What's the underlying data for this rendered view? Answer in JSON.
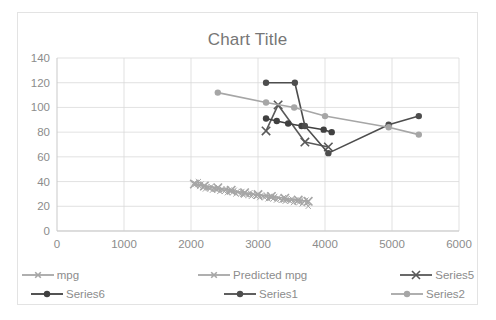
{
  "chart": {
    "title": "Chart Title",
    "border_color": "#e3e3e3",
    "background": "#ffffff",
    "grid_color": "#d9d9d9",
    "text_color": "#8c8c8c",
    "title_color": "#767676"
  },
  "legend": {
    "position": "bottom",
    "rows": [
      [
        {
          "label": "mpg",
          "color": "#a6a6a6",
          "marker": "x-small"
        },
        {
          "label": "Predicted mpg",
          "color": "#a6a6a6",
          "marker": "x-small"
        },
        {
          "label": "Series5",
          "color": "#595959",
          "marker": "x"
        }
      ],
      [
        {
          "label": "Series6",
          "color": "#404040",
          "marker": "circle"
        },
        {
          "label": "Series1",
          "color": "#4d4d4d",
          "marker": "circle"
        },
        {
          "label": "Series2",
          "color": "#a6a6a6",
          "marker": "circle"
        }
      ]
    ]
  },
  "chart_data": {
    "type": "scatter",
    "title": "Chart Title",
    "xlabel": "",
    "ylabel": "",
    "xlim": [
      0,
      6000
    ],
    "ylim": [
      0,
      140
    ],
    "xticks": [
      0,
      1000,
      2000,
      3000,
      4000,
      5000,
      6000
    ],
    "yticks": [
      0,
      20,
      40,
      60,
      80,
      100,
      120,
      140
    ],
    "grid": true,
    "legend_position": "bottom",
    "series": [
      {
        "name": "mpg",
        "color": "#a6a6a6",
        "marker": "x",
        "line": true,
        "points": [
          [
            2050,
            39
          ],
          [
            2075,
            38
          ],
          [
            2100,
            37.5
          ],
          [
            2110,
            40
          ],
          [
            2130,
            36
          ],
          [
            2150,
            38
          ],
          [
            2180,
            35
          ],
          [
            2200,
            37
          ],
          [
            2215,
            34
          ],
          [
            2240,
            36
          ],
          [
            2260,
            35
          ],
          [
            2280,
            34
          ],
          [
            2300,
            36
          ],
          [
            2320,
            33
          ],
          [
            2345,
            35
          ],
          [
            2360,
            34
          ],
          [
            2390,
            33
          ],
          [
            2410,
            35
          ],
          [
            2430,
            32
          ],
          [
            2460,
            34
          ],
          [
            2480,
            33
          ],
          [
            2500,
            32
          ],
          [
            2525,
            34
          ],
          [
            2545,
            31
          ],
          [
            2570,
            33
          ],
          [
            2600,
            32
          ],
          [
            2620,
            31
          ],
          [
            2645,
            33
          ],
          [
            2670,
            30
          ],
          [
            2690,
            32
          ],
          [
            2715,
            31
          ],
          [
            2740,
            30
          ],
          [
            2760,
            32
          ],
          [
            2785,
            29
          ],
          [
            2810,
            31
          ],
          [
            2830,
            30
          ],
          [
            2855,
            29
          ],
          [
            2880,
            31
          ],
          [
            2900,
            28
          ],
          [
            2925,
            30
          ],
          [
            2950,
            29
          ],
          [
            2975,
            28
          ],
          [
            3000,
            30
          ],
          [
            3025,
            27
          ],
          [
            3050,
            29
          ],
          [
            3075,
            28
          ],
          [
            3100,
            27
          ],
          [
            3125,
            29
          ],
          [
            3150,
            26
          ],
          [
            3175,
            28
          ],
          [
            3200,
            27
          ],
          [
            3225,
            26
          ],
          [
            3250,
            28
          ],
          [
            3275,
            25
          ],
          [
            3300,
            27
          ],
          [
            3330,
            26
          ],
          [
            3355,
            25
          ],
          [
            3380,
            27
          ],
          [
            3405,
            24
          ],
          [
            3430,
            26
          ],
          [
            3455,
            25
          ],
          [
            3480,
            24
          ],
          [
            3505,
            26
          ],
          [
            3530,
            23
          ],
          [
            3560,
            25
          ],
          [
            3585,
            24
          ],
          [
            3610,
            23
          ],
          [
            3635,
            25
          ],
          [
            3660,
            22
          ],
          [
            3690,
            24
          ],
          [
            3715,
            25
          ],
          [
            3740,
            23
          ],
          [
            3750,
            20
          ]
        ]
      },
      {
        "name": "Predicted mpg",
        "color": "#a6a6a6",
        "marker": "x",
        "line": true,
        "points": [
          [
            2050,
            38
          ],
          [
            2200,
            36.5
          ],
          [
            2400,
            35
          ],
          [
            2600,
            33
          ],
          [
            2800,
            31
          ],
          [
            3000,
            29.5
          ],
          [
            3200,
            28
          ],
          [
            3400,
            26.5
          ],
          [
            3600,
            25
          ],
          [
            3750,
            24
          ]
        ]
      },
      {
        "name": "Series5",
        "color": "#595959",
        "marker": "x",
        "line": true,
        "points": [
          [
            3120,
            81
          ],
          [
            3300,
            102
          ],
          [
            3700,
            72
          ],
          [
            4050,
            68
          ]
        ]
      },
      {
        "name": "Series6",
        "color": "#404040",
        "marker": "circle",
        "line": true,
        "points": [
          [
            3120,
            91
          ],
          [
            3280,
            89
          ],
          [
            3450,
            87
          ],
          [
            3650,
            85
          ],
          [
            3980,
            82
          ],
          [
            4100,
            80
          ]
        ]
      },
      {
        "name": "Series1",
        "color": "#4d4d4d",
        "marker": "circle",
        "line": true,
        "points": [
          [
            3120,
            120
          ],
          [
            3550,
            120
          ],
          [
            3700,
            85
          ],
          [
            4050,
            63
          ],
          [
            4950,
            86
          ],
          [
            5400,
            93
          ]
        ]
      },
      {
        "name": "Series2",
        "color": "#a6a6a6",
        "marker": "circle",
        "line": true,
        "points": [
          [
            2400,
            112
          ],
          [
            3120,
            104
          ],
          [
            3540,
            100
          ],
          [
            4000,
            93
          ],
          [
            4950,
            84
          ],
          [
            5400,
            78
          ]
        ]
      }
    ]
  }
}
